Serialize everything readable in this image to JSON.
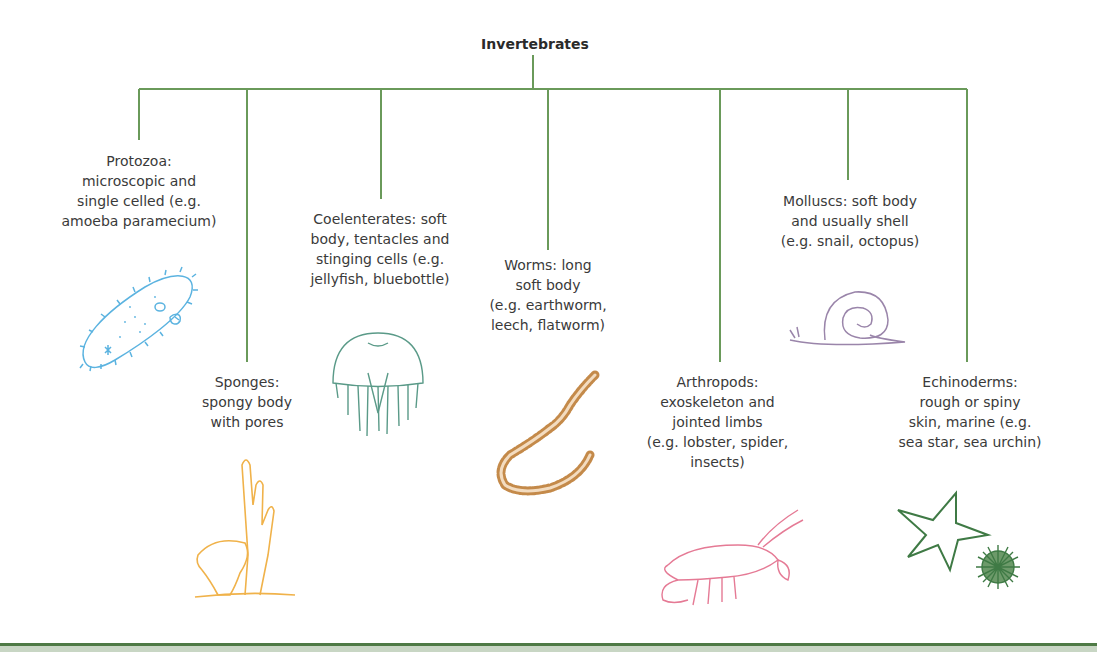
{
  "title": "Invertebrates",
  "colors": {
    "tree_line": "#6a9a5a",
    "protozoa": "#5bb3e0",
    "sponges": "#f0b24a",
    "coelenterates": "#5a9a88",
    "worms": "#c48a4a",
    "arthropods": "#e57a95",
    "molluscs": "#9a85aa",
    "echinoderms": "#3f7a45"
  },
  "groups": [
    {
      "name": "Protozoa",
      "label": "Protozoa: microscopic and single celled (e.g. amoeba paramecium)",
      "lines": [
        "Protozoa:",
        "microscopic and",
        "single celled (e.g.",
        "amoeba paramecium)"
      ],
      "icon": "paramecium-icon"
    },
    {
      "name": "Sponges",
      "label": "Sponges: spongy body with pores",
      "lines": [
        "Sponges:",
        "spongy body",
        "with pores"
      ],
      "icon": "sponge-icon"
    },
    {
      "name": "Coelenterates",
      "label": "Coelenterates: soft body, tentacles and stinging cells (e.g. jellyfish, bluebottle)",
      "lines": [
        "Coelenterates: soft",
        "body, tentacles and",
        "stinging cells (e.g.",
        "jellyfish, bluebottle)"
      ],
      "icon": "jellyfish-icon"
    },
    {
      "name": "Worms",
      "label": "Worms: long soft body (e.g. earthworm, leech, flatworm)",
      "lines": [
        "Worms: long",
        "soft body",
        "(e.g. earthworm,",
        "leech, flatworm)"
      ],
      "icon": "worm-icon"
    },
    {
      "name": "Arthropods",
      "label": "Arthropods: exoskeleton and jointed limbs (e.g. lobster, spider, insects)",
      "lines": [
        "Arthropods:",
        "exoskeleton and",
        "jointed limbs",
        "(e.g. lobster, spider,",
        "insects)"
      ],
      "icon": "lobster-icon"
    },
    {
      "name": "Molluscs",
      "label": "Molluscs: soft body and usually shell (e.g. snail, octopus)",
      "lines": [
        "Molluscs: soft body",
        "and usually shell",
        "(e.g. snail, octopus)"
      ],
      "icon": "snail-icon"
    },
    {
      "name": "Echinoderms",
      "label": "Echinoderms: rough or spiny skin, marine (e.g. sea star, sea urchin)",
      "lines": [
        "Echinoderms:",
        "rough or spiny",
        "skin, marine (e.g.",
        "sea star, sea urchin)"
      ],
      "icon": "starfish-urchin-icon"
    }
  ]
}
